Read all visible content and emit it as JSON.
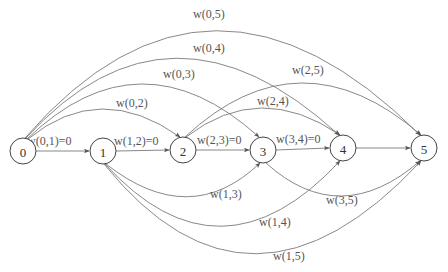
{
  "diagram": {
    "type": "directed-graph",
    "nodes": [
      {
        "id": "0",
        "label": "0",
        "x": 23,
        "y": 151
      },
      {
        "id": "1",
        "label": "1",
        "x": 103,
        "y": 151
      },
      {
        "id": "2",
        "label": "2",
        "x": 183,
        "y": 150
      },
      {
        "id": "3",
        "label": "3",
        "x": 263,
        "y": 150
      },
      {
        "id": "4",
        "label": "4",
        "x": 343,
        "y": 148
      },
      {
        "id": "5",
        "label": "5",
        "x": 424,
        "y": 148
      }
    ],
    "edges": [
      {
        "from": "0",
        "to": "1",
        "label": "w(0,1)=0"
      },
      {
        "from": "1",
        "to": "2",
        "label": "w(1,2)=0"
      },
      {
        "from": "2",
        "to": "3",
        "label": "w(2,3)=0"
      },
      {
        "from": "3",
        "to": "4",
        "label": "w(3,4)=0"
      },
      {
        "from": "4",
        "to": "5",
        "label": ""
      },
      {
        "from": "0",
        "to": "2",
        "label": "w(0,2)"
      },
      {
        "from": "0",
        "to": "3",
        "label": "w(0,3)"
      },
      {
        "from": "0",
        "to": "4",
        "label": "w(0,4)"
      },
      {
        "from": "0",
        "to": "5",
        "label": "w(0,5)"
      },
      {
        "from": "2",
        "to": "4",
        "label": "w(2,4)"
      },
      {
        "from": "2",
        "to": "5",
        "label": "w(2,5)"
      },
      {
        "from": "1",
        "to": "3",
        "label": "w(1,3)"
      },
      {
        "from": "1",
        "to": "4",
        "label": "w(1,4)"
      },
      {
        "from": "1",
        "to": "5",
        "label": "w(1,5)"
      },
      {
        "from": "3",
        "to": "5",
        "label": "w(3,5)"
      }
    ]
  },
  "labels": {
    "n0": "0",
    "n1": "1",
    "n2": "2",
    "n3": "3",
    "n4": "4",
    "n5": "5",
    "e01": "w(0,1)=0",
    "e12": "w(1,2)=0",
    "e23": "w(2,3)=0",
    "e34": "w(3,4)=0",
    "e02": "w(0,2)",
    "e03": "w(0,3)",
    "e04": "w(0,4)",
    "e05": "w(0,5)",
    "e24": "w(2,4)",
    "e25": "w(2,5)",
    "e13": "w(1,3)",
    "e14": "w(1,4)",
    "e15": "w(1,5)",
    "e35": "w(3,5)"
  },
  "colors": {
    "edge": "#7a7a7a",
    "node_stroke": "#444444",
    "text": "#555555"
  }
}
